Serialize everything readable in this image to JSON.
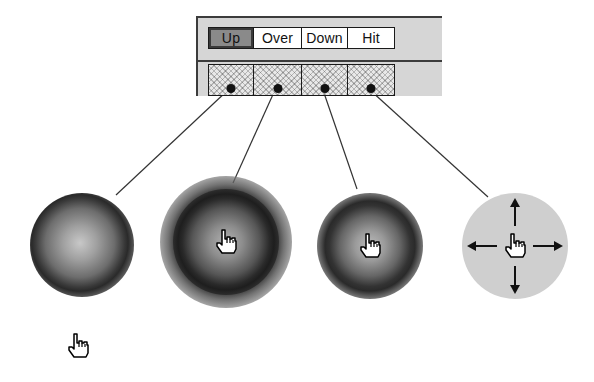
{
  "timeline": {
    "frame_labels": [
      {
        "label": "Up",
        "active": true
      },
      {
        "label": "Over",
        "active": false
      },
      {
        "label": "Down",
        "active": false
      },
      {
        "label": "Hit",
        "active": false
      }
    ],
    "keyframes": 4
  },
  "states": [
    {
      "name": "up",
      "description": "Up state button",
      "cursor": "none"
    },
    {
      "name": "over",
      "description": "Over state button with glow",
      "cursor": "hand-pointer-icon"
    },
    {
      "name": "down",
      "description": "Down state button",
      "cursor": "hand-pointer-icon"
    },
    {
      "name": "hit",
      "description": "Hit area with move arrows",
      "cursor": "hand-pointer-icon"
    }
  ],
  "standalone_cursor": "hand-pointer-icon",
  "colors": {
    "panel_bg": "#d6d6d6",
    "panel_border": "#3c3c3c",
    "active_label_bg": "#8a8a8a",
    "hit_area": "#cfcfcf",
    "line": "#333333"
  }
}
